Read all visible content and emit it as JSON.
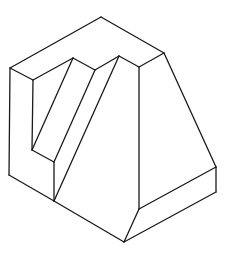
{
  "diagram": {
    "type": "isometric-line-drawing",
    "title": "",
    "stroke_color": "#1a1a1a",
    "background_color": "#ffffff",
    "vertices": {
      "A": [
        10,
        68
      ],
      "B": [
        101,
        17
      ],
      "C": [
        164,
        53
      ],
      "D": [
        139,
        67
      ],
      "E": [
        119,
        56
      ],
      "F": [
        95,
        70
      ],
      "G": [
        73,
        58
      ],
      "H": [
        33,
        80
      ],
      "I": [
        32,
        150
      ],
      "J": [
        54,
        162
      ],
      "K": [
        9,
        175
      ],
      "L": [
        54,
        201
      ],
      "M": [
        124,
        242
      ],
      "N": [
        139,
        209
      ],
      "O": [
        216,
        167
      ],
      "P": [
        216,
        192
      ]
    },
    "edges": [
      [
        "A",
        "B"
      ],
      [
        "B",
        "C"
      ],
      [
        "C",
        "D"
      ],
      [
        "D",
        "E"
      ],
      [
        "E",
        "F"
      ],
      [
        "F",
        "G"
      ],
      [
        "G",
        "H"
      ],
      [
        "H",
        "A"
      ],
      [
        "A",
        "K"
      ],
      [
        "K",
        "L"
      ],
      [
        "L",
        "M"
      ],
      [
        "M",
        "N"
      ],
      [
        "N",
        "D"
      ],
      [
        "C",
        "O"
      ],
      [
        "O",
        "P"
      ],
      [
        "P",
        "M"
      ],
      [
        "O",
        "N"
      ],
      [
        "H",
        "I"
      ],
      [
        "I",
        "J"
      ],
      [
        "J",
        "L"
      ],
      [
        "G",
        "I"
      ],
      [
        "F",
        "J"
      ],
      [
        "E",
        "L"
      ]
    ]
  }
}
